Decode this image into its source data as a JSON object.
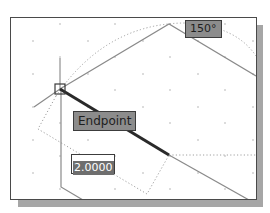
{
  "viewport": {
    "background": "#ffffff",
    "border_color": "#4a4a4a",
    "shadow_color": "#a6a6a6"
  },
  "tooltips": {
    "angle": "150°",
    "object_snap": "Endpoint"
  },
  "dynamic_input": {
    "value": "2.0000"
  },
  "drawing": {
    "line_color": "#8a8a8a",
    "active_segment_color": "#2a2a2a",
    "tracking_color": "#9a9a9a"
  },
  "icons": {
    "endpoint_marker": "endpoint-snap-marker-icon",
    "crosshair": "crosshair-cursor-icon"
  }
}
